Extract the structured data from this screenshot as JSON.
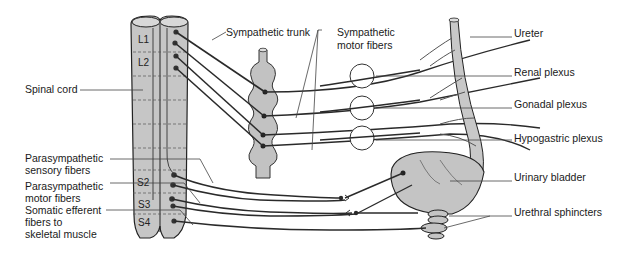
{
  "colors": {
    "tissue": "#c4c4c4",
    "tissue_light": "#d6d6d6",
    "nerve": "#2a2a2a",
    "leader": "#333333",
    "background": "#ffffff"
  },
  "segments": {
    "l1": "L1",
    "l2": "L2",
    "s2": "S2",
    "s3": "S3",
    "s4": "S4"
  },
  "labels": {
    "spinal_cord": "Spinal cord",
    "sympathetic_trunk": "Sympathetic trunk",
    "sympathetic_motor_fibers_1": "Sympathetic",
    "sympathetic_motor_fibers_2": "motor fibers",
    "ureter": "Ureter",
    "renal_plexus": "Renal plexus",
    "gonadal_plexus": "Gonadal plexus",
    "hypogastric_plexus": "Hypogastric plexus",
    "urinary_bladder": "Urinary bladder",
    "urethral_sphincters": "Urethral sphincters",
    "parasympathetic_sensory_1": "Parasympathetic",
    "parasympathetic_sensory_2": "sensory fibers",
    "parasympathetic_motor_1": "Parasympathetic",
    "parasympathetic_motor_2": "motor fibers",
    "somatic_efferent_1": "Somatic efferent",
    "somatic_efferent_2": "fibers to",
    "somatic_efferent_3": "skeletal muscle"
  }
}
